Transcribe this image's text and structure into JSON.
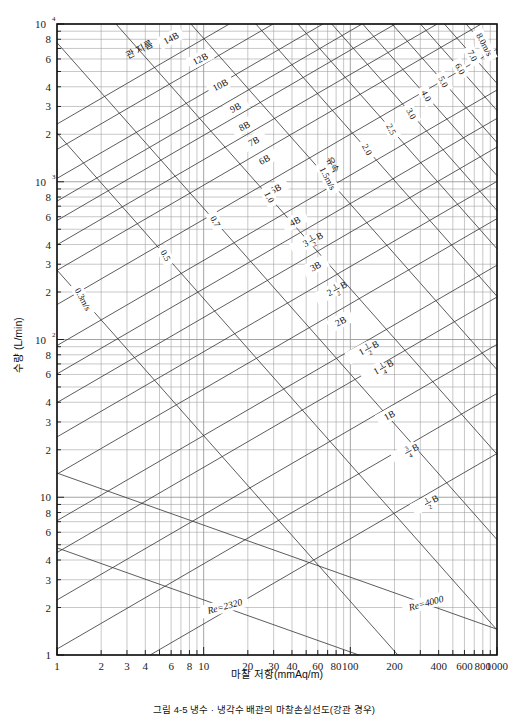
{
  "figure": {
    "caption": "그림 4-5  냉수 · 냉각수 배관의 마찰손실선도(강관 경우)",
    "background_color": "#ffffff",
    "line_color": "#3a3a3a",
    "grid_color": "#888888",
    "frame_color": "#111111"
  },
  "axes": {
    "x": {
      "title": "마찰 저항(mmAq/m)",
      "min": 1,
      "max": 1000,
      "scale": "log",
      "ticks": [
        {
          "value": 1,
          "label": "1"
        },
        {
          "value": 2,
          "label": "2"
        },
        {
          "value": 3,
          "label": "3"
        },
        {
          "value": 4,
          "label": "4"
        },
        {
          "value": 6,
          "label": "6"
        },
        {
          "value": 8,
          "label": "8"
        },
        {
          "value": 10,
          "label": "10"
        },
        {
          "value": 20,
          "label": "20"
        },
        {
          "value": 30,
          "label": "30"
        },
        {
          "value": 40,
          "label": "40"
        },
        {
          "value": 60,
          "label": "60"
        },
        {
          "value": 80,
          "label": "80"
        },
        {
          "value": 100,
          "label": "100"
        },
        {
          "value": 200,
          "label": "200"
        },
        {
          "value": 400,
          "label": "400"
        },
        {
          "value": 600,
          "label": "600"
        },
        {
          "value": 800,
          "label": "800"
        },
        {
          "value": 1000,
          "label": "1000"
        }
      ],
      "minor_ticks": [
        5,
        7,
        9,
        50,
        70,
        90,
        300,
        500,
        700,
        900
      ]
    },
    "y": {
      "title": "수량 (L/min)",
      "min": 1,
      "max": 10000,
      "scale": "log",
      "ticks": [
        {
          "value": 1,
          "label": "1"
        },
        {
          "value": 2,
          "label": "2"
        },
        {
          "value": 3,
          "label": "3"
        },
        {
          "value": 4,
          "label": "4"
        },
        {
          "value": 6,
          "label": "6"
        },
        {
          "value": 8,
          "label": "8"
        },
        {
          "value": 10,
          "label": "10"
        },
        {
          "value": 20,
          "label": "2"
        },
        {
          "value": 30,
          "label": "3"
        },
        {
          "value": 40,
          "label": "4"
        },
        {
          "value": 60,
          "label": "6"
        },
        {
          "value": 80,
          "label": "8"
        },
        {
          "value": 100,
          "label": "10",
          "sup": "2"
        },
        {
          "value": 200,
          "label": "2"
        },
        {
          "value": 300,
          "label": "3"
        },
        {
          "value": 400,
          "label": "4"
        },
        {
          "value": 600,
          "label": "6"
        },
        {
          "value": 800,
          "label": "8"
        },
        {
          "value": 1000,
          "label": "10",
          "sup": "3"
        },
        {
          "value": 2000,
          "label": "2"
        },
        {
          "value": 3000,
          "label": "3"
        },
        {
          "value": 4000,
          "label": "4"
        },
        {
          "value": 6000,
          "label": "6"
        },
        {
          "value": 8000,
          "label": "8"
        },
        {
          "value": 10000,
          "label": "10",
          "sup": "4"
        }
      ]
    }
  },
  "chart_data": {
    "type": "line",
    "title": "냉수 · 냉각수 배관의 마찰손실선도(강관 경우)",
    "xlabel": "마찰 저항(mmAq/m)",
    "ylabel": "수량 (L/min)",
    "xlim": [
      1,
      1000
    ],
    "ylim": [
      1,
      10000
    ],
    "xscale": "log",
    "yscale": "log",
    "grid": true,
    "legend_position": "none",
    "pipe_diameter_series_label": "관 지름",
    "pipe_diameter_lines": [
      {
        "label": "14B",
        "anchor_x": 9.0,
        "anchor_y": 7600,
        "label_x": 6.0,
        "label_y": 8100
      },
      {
        "label": "12B",
        "anchor_x": 13.0,
        "anchor_y": 6400,
        "label_x": 9.5,
        "label_y": 6000
      },
      {
        "label": "10B",
        "anchor_x": 18.0,
        "anchor_y": 5000,
        "label_x": 13.0,
        "label_y": 4100
      },
      {
        "label": "9B",
        "anchor_x": 22.0,
        "anchor_y": 4000,
        "label_x": 16.5,
        "label_y": 2950
      },
      {
        "label": "8B",
        "anchor_x": 26.0,
        "anchor_y": 3300,
        "label_x": 19.0,
        "label_y": 2250
      },
      {
        "label": "7B",
        "anchor_x": 30.0,
        "anchor_y": 2500,
        "label_x": 22.0,
        "label_y": 1800
      },
      {
        "label": "6B",
        "anchor_x": 36.0,
        "anchor_y": 1900,
        "label_x": 26.0,
        "label_y": 1380
      },
      {
        "label": "5B",
        "anchor_x": 45.0,
        "anchor_y": 1300,
        "label_x": 31.0,
        "label_y": 900
      },
      {
        "label": "4B",
        "anchor_x": 58.0,
        "anchor_y": 820,
        "label_x": 42.0,
        "label_y": 560
      },
      {
        "label": "3 1/2 B",
        "anchor_x": 70.0,
        "anchor_y": 600,
        "label_x": 48.0,
        "label_y": 400
      },
      {
        "label": "3B",
        "anchor_x": 82.0,
        "anchor_y": 430,
        "label_x": 58.0,
        "label_y": 290
      },
      {
        "label": "2 1/2 B",
        "anchor_x": 100.0,
        "anchor_y": 290,
        "label_x": 70.0,
        "label_y": 195
      },
      {
        "label": "2B",
        "anchor_x": 125.0,
        "anchor_y": 190,
        "label_x": 86.0,
        "label_y": 130
      },
      {
        "label": "1 1/2 B",
        "anchor_x": 160.0,
        "anchor_y": 110,
        "label_x": 115.0,
        "label_y": 82
      },
      {
        "label": "1 1/4 B",
        "anchor_x": 200.0,
        "anchor_y": 78,
        "label_x": 145.0,
        "label_y": 62
      },
      {
        "label": "1B",
        "anchor_x": 260.0,
        "anchor_y": 45,
        "label_x": 185.0,
        "label_y": 33
      },
      {
        "label": "3/4 B",
        "anchor_x": 330.0,
        "anchor_y": 25,
        "label_x": 235.0,
        "label_y": 19
      },
      {
        "label": "1/2 B",
        "anchor_x": 430.0,
        "anchor_y": 12,
        "label_x": 320.0,
        "label_y": 9.0
      }
    ],
    "velocity_series_label": "유속",
    "velocity_unit": "m/s",
    "velocity_lines": [
      {
        "label": "0.3m/s",
        "value": 0.3,
        "label_x": 1.5,
        "label_y": 180
      },
      {
        "label": "0.5",
        "value": 0.5,
        "label_x": 5.5,
        "label_y": 340
      },
      {
        "label": "0.7",
        "value": 0.7,
        "label_x": 12.0,
        "label_y": 560
      },
      {
        "label": "1.0",
        "value": 1.0,
        "label_x": 28.0,
        "label_y": 800
      },
      {
        "label": "1.5m/s",
        "value": 1.5,
        "label_x": 70.0,
        "label_y": 1050
      },
      {
        "label": "2.0",
        "value": 2.0,
        "label_x": 130.0,
        "label_y": 1600
      },
      {
        "label": "2.5",
        "value": 2.5,
        "label_x": 190.0,
        "label_y": 2150
      },
      {
        "label": "3.0",
        "value": 3.0,
        "label_x": 260.0,
        "label_y": 2700
      },
      {
        "label": "4.0",
        "value": 4.0,
        "label_x": 330.0,
        "label_y": 3500
      },
      {
        "label": "5.0",
        "value": 5.0,
        "label_x": 430.0,
        "label_y": 4300
      },
      {
        "label": "6.0",
        "value": 6.0,
        "label_x": 560.0,
        "label_y": 5200
      },
      {
        "label": "7.0",
        "value": 7.0,
        "label_x": 680.0,
        "label_y": 6300
      },
      {
        "label": "8.0m/s",
        "value": 8.0,
        "label_x": 820.0,
        "label_y": 7400
      }
    ],
    "reynolds_lines": [
      {
        "label": "Re=2320",
        "value": 2320,
        "label_x": 14.0,
        "label_y": 2.0
      },
      {
        "label": "Re=4000",
        "value": 4000,
        "label_x": 330.0,
        "label_y": 2.1
      }
    ]
  }
}
